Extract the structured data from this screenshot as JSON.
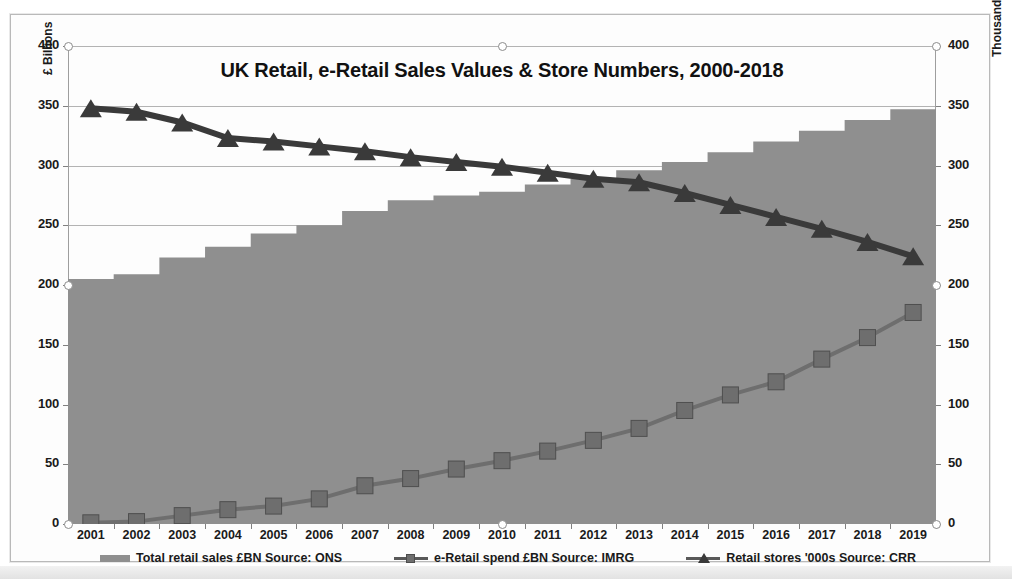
{
  "chart_data": {
    "type": "area",
    "title": "UK Retail, e-Retail Sales Values & Store Numbers, 2000-2018",
    "categories": [
      "2001",
      "2002",
      "2003",
      "2004",
      "2005",
      "2006",
      "2007",
      "2008",
      "2009",
      "2010",
      "2011",
      "2012",
      "2013",
      "2014",
      "2015",
      "2016",
      "2017",
      "2018",
      "2019"
    ],
    "xlabel": "",
    "ylabel": "£ Billions",
    "ylabel_secondary": "Thousands",
    "ylim": [
      0,
      400
    ],
    "ylim_secondary": [
      0,
      400
    ],
    "yticks": [
      0,
      50,
      100,
      150,
      200,
      250,
      300,
      350,
      400
    ],
    "yticks_secondary": [
      0,
      50,
      100,
      150,
      200,
      250,
      300,
      350,
      400
    ],
    "grid": true,
    "legend_position": "bottom",
    "series": [
      {
        "name": "Total retail sales £BN  Source: ONS",
        "type": "area",
        "axis": "left",
        "color": "#8f8f8f",
        "values": [
          205,
          209,
          223,
          232,
          243,
          250,
          262,
          271,
          275,
          278,
          284,
          289,
          296,
          303,
          311,
          320,
          329,
          338,
          347
        ]
      },
      {
        "name": "e-Retail spend £BN Source: IMRG",
        "type": "line",
        "marker": "square",
        "axis": "left",
        "color": "#6e6e6e",
        "values": [
          1,
          2,
          7,
          12,
          15,
          21,
          32,
          38,
          46,
          53,
          61,
          70,
          80,
          95,
          108,
          119,
          138,
          156,
          177
        ]
      },
      {
        "name": "Retail stores '000s  Source: CRR",
        "type": "line",
        "marker": "triangle",
        "axis": "right",
        "color": "#3a3a3a",
        "values": [
          348,
          345,
          336,
          323,
          320,
          316,
          312,
          307,
          303,
          299,
          294,
          289,
          286,
          277,
          267,
          257,
          247,
          236,
          224
        ]
      }
    ]
  },
  "axes": {
    "left_title": "£ Billions",
    "right_title": "Thousands"
  },
  "legend": {
    "items": [
      {
        "label": "Total retail sales £BN  Source: ONS",
        "marker": "area-swatch"
      },
      {
        "label": "e-Retail spend £BN Source: IMRG",
        "marker": "line-square-marker"
      },
      {
        "label": "Retail stores '000s  Source: CRR",
        "marker": "line-triangle-marker"
      }
    ]
  }
}
